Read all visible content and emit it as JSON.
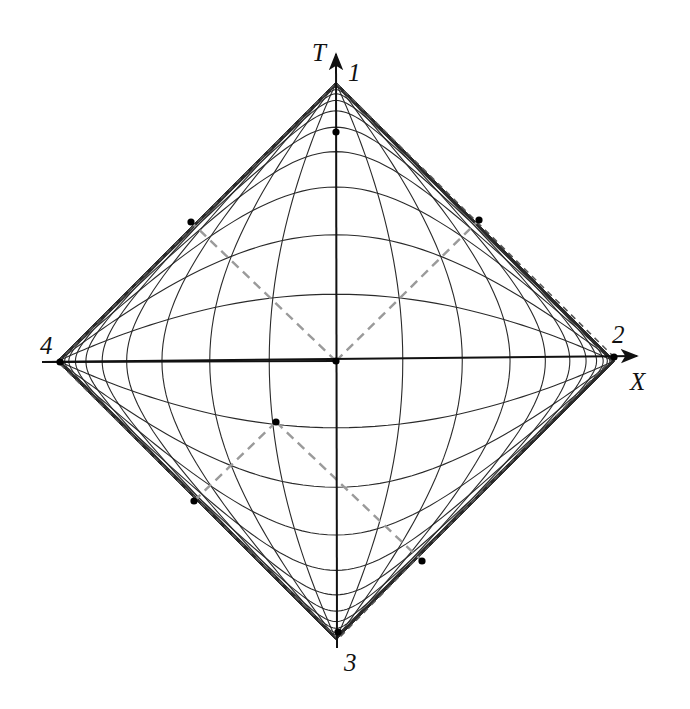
{
  "figure": {
    "type": "conformal compactification diagram (Penrose-style)",
    "axes": {
      "horizontal_label": "X",
      "vertical_label": "T"
    },
    "corner_labels": {
      "top": "1",
      "right": "2",
      "bottom": "3",
      "left": "4"
    },
    "geometry": {
      "center": [
        336,
        361
      ],
      "radius_px": 278,
      "grid_step": 0.245,
      "grid_lines_per_side": 13,
      "grid_extent": 6.0
    },
    "colors": {
      "grid": "#2a2a2a",
      "axes": "#111111",
      "boundary_dashed": "#555555",
      "light_cone_dashed": "#9a9a9a",
      "points": "#000000"
    },
    "points": [
      {
        "name": "origin",
        "xy": [
          336,
          361
        ]
      },
      {
        "name": "event-p",
        "xy": [
          276,
          422
        ]
      },
      {
        "name": "upper-left-boundary-point",
        "xy": [
          191,
          222
        ]
      },
      {
        "name": "upper-right-boundary-point",
        "xy": [
          479,
          220
        ]
      },
      {
        "name": "lower-left-boundary-point",
        "xy": [
          194,
          501
        ]
      },
      {
        "name": "lower-right-boundary-point",
        "xy": [
          422,
          561
        ]
      },
      {
        "name": "vertex-1",
        "xy": [
          336,
          132
        ]
      },
      {
        "name": "vertex-2",
        "xy": [
          614,
          357
        ]
      },
      {
        "name": "vertex-4",
        "xy": [
          60,
          362
        ]
      },
      {
        "name": "vertex-3",
        "xy": [
          338,
          632
        ]
      }
    ],
    "light_cones": [
      {
        "from": [
          336,
          361
        ],
        "to": [
          191,
          222
        ]
      },
      {
        "from": [
          336,
          361
        ],
        "to": [
          479,
          220
        ]
      },
      {
        "from": [
          276,
          422
        ],
        "to": [
          194,
          501
        ]
      },
      {
        "from": [
          276,
          422
        ],
        "to": [
          422,
          561
        ]
      }
    ]
  }
}
